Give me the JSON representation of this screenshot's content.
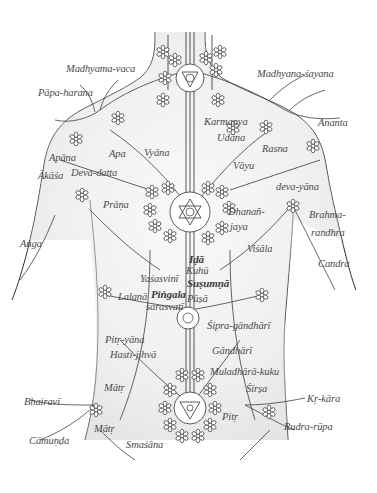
{
  "diagram": {
    "colors": {
      "background": "#ffffff",
      "line": "#2e2e2e",
      "shade": "#d6d6d6",
      "label": "#4a4a4a"
    },
    "labels": [
      {
        "id": "madhyama-vaca",
        "text": "Madhyama-vaca",
        "x": 66,
        "y": 70
      },
      {
        "id": "madhyana-sayana",
        "text": "Madhyana-śayana",
        "x": 257,
        "y": 75
      },
      {
        "id": "papa-harana",
        "text": "Pāpa-harana",
        "x": 38,
        "y": 94
      },
      {
        "id": "karmanya",
        "text": "Karmanya",
        "x": 204,
        "y": 123
      },
      {
        "id": "ananta",
        "text": "Ananta",
        "x": 318,
        "y": 124
      },
      {
        "id": "udana",
        "text": "Udāna",
        "x": 217,
        "y": 139
      },
      {
        "id": "rasna",
        "text": "Rasna",
        "x": 262,
        "y": 150
      },
      {
        "id": "apana",
        "text": "Apāna",
        "x": 49,
        "y": 159
      },
      {
        "id": "apa",
        "text": "Apa",
        "x": 109,
        "y": 155
      },
      {
        "id": "vyana",
        "text": "Vyāna",
        "x": 144,
        "y": 154
      },
      {
        "id": "vayu",
        "text": "Vāyu",
        "x": 233,
        "y": 167
      },
      {
        "id": "akasa",
        "text": "Ākāśa",
        "x": 38,
        "y": 177
      },
      {
        "id": "deva-datta",
        "text": "Deva-datta",
        "x": 71,
        "y": 174
      },
      {
        "id": "deva-yana",
        "text": "deva-yāna",
        "x": 276,
        "y": 188
      },
      {
        "id": "prana",
        "text": "Prāṇa",
        "x": 103,
        "y": 206
      },
      {
        "id": "dhananjaya",
        "text": "Dhanañ-",
        "x": 228,
        "y": 213
      },
      {
        "id": "jaya",
        "text": "jaya",
        "x": 230,
        "y": 228
      },
      {
        "id": "brahma",
        "text": "Brahma-",
        "x": 309,
        "y": 216
      },
      {
        "id": "randhra",
        "text": "randhra",
        "x": 311,
        "y": 234
      },
      {
        "id": "anga",
        "text": "Aṅga",
        "x": 20,
        "y": 245
      },
      {
        "id": "visala",
        "text": "Viśāla",
        "x": 247,
        "y": 250
      },
      {
        "id": "ida",
        "text": "Iḍā",
        "x": 189,
        "y": 260
      },
      {
        "id": "candra",
        "text": "Candra",
        "x": 318,
        "y": 265
      },
      {
        "id": "kuhu",
        "text": "Kuhū",
        "x": 186,
        "y": 272
      },
      {
        "id": "yasasvini",
        "text": "Yaśasvinī",
        "x": 140,
        "y": 280
      },
      {
        "id": "susumna",
        "text": "Suṣumṇā",
        "x": 187,
        "y": 284
      },
      {
        "id": "pingala",
        "text": "Piṅgala",
        "x": 151,
        "y": 295
      },
      {
        "id": "lalana",
        "text": "Lalanā",
        "x": 118,
        "y": 298
      },
      {
        "id": "pusa",
        "text": "Pūṣā",
        "x": 187,
        "y": 300
      },
      {
        "id": "sarasvati",
        "text": "sarasvatī",
        "x": 146,
        "y": 308
      },
      {
        "id": "sipra-gandhari",
        "text": "Śipra-gāndhārī",
        "x": 207,
        "y": 327
      },
      {
        "id": "pitr-yana",
        "text": "Pitṛ-yāna",
        "x": 105,
        "y": 341
      },
      {
        "id": "gandhari",
        "text": "Gāndhārī",
        "x": 212,
        "y": 352
      },
      {
        "id": "hasti-jihva",
        "text": "Hasti-jihvā",
        "x": 110,
        "y": 356
      },
      {
        "id": "muladhara-kuku",
        "text": "Muladhārā-kuku",
        "x": 210,
        "y": 373
      },
      {
        "id": "matr-upper",
        "text": "Mātṛ",
        "x": 104,
        "y": 389
      },
      {
        "id": "sirsa",
        "text": "Śīrṣa",
        "x": 246,
        "y": 390
      },
      {
        "id": "kr-kara",
        "text": "Kṛ-kāra",
        "x": 307,
        "y": 400
      },
      {
        "id": "bhairavi",
        "text": "Bhairavī",
        "x": 24,
        "y": 403
      },
      {
        "id": "pitr",
        "text": "Pitṛ",
        "x": 222,
        "y": 418
      },
      {
        "id": "rudra-rupa",
        "text": "Rudra-rūpa",
        "x": 284,
        "y": 428
      },
      {
        "id": "matr-lower",
        "text": "Mātṛ",
        "x": 94,
        "y": 430
      },
      {
        "id": "camunda",
        "text": "Cāmuṇḍa",
        "x": 29,
        "y": 442
      },
      {
        "id": "smasana",
        "text": "Smaśāna",
        "x": 126,
        "y": 446
      }
    ],
    "bold_labels": [
      "ida",
      "susumna",
      "pingala"
    ]
  }
}
